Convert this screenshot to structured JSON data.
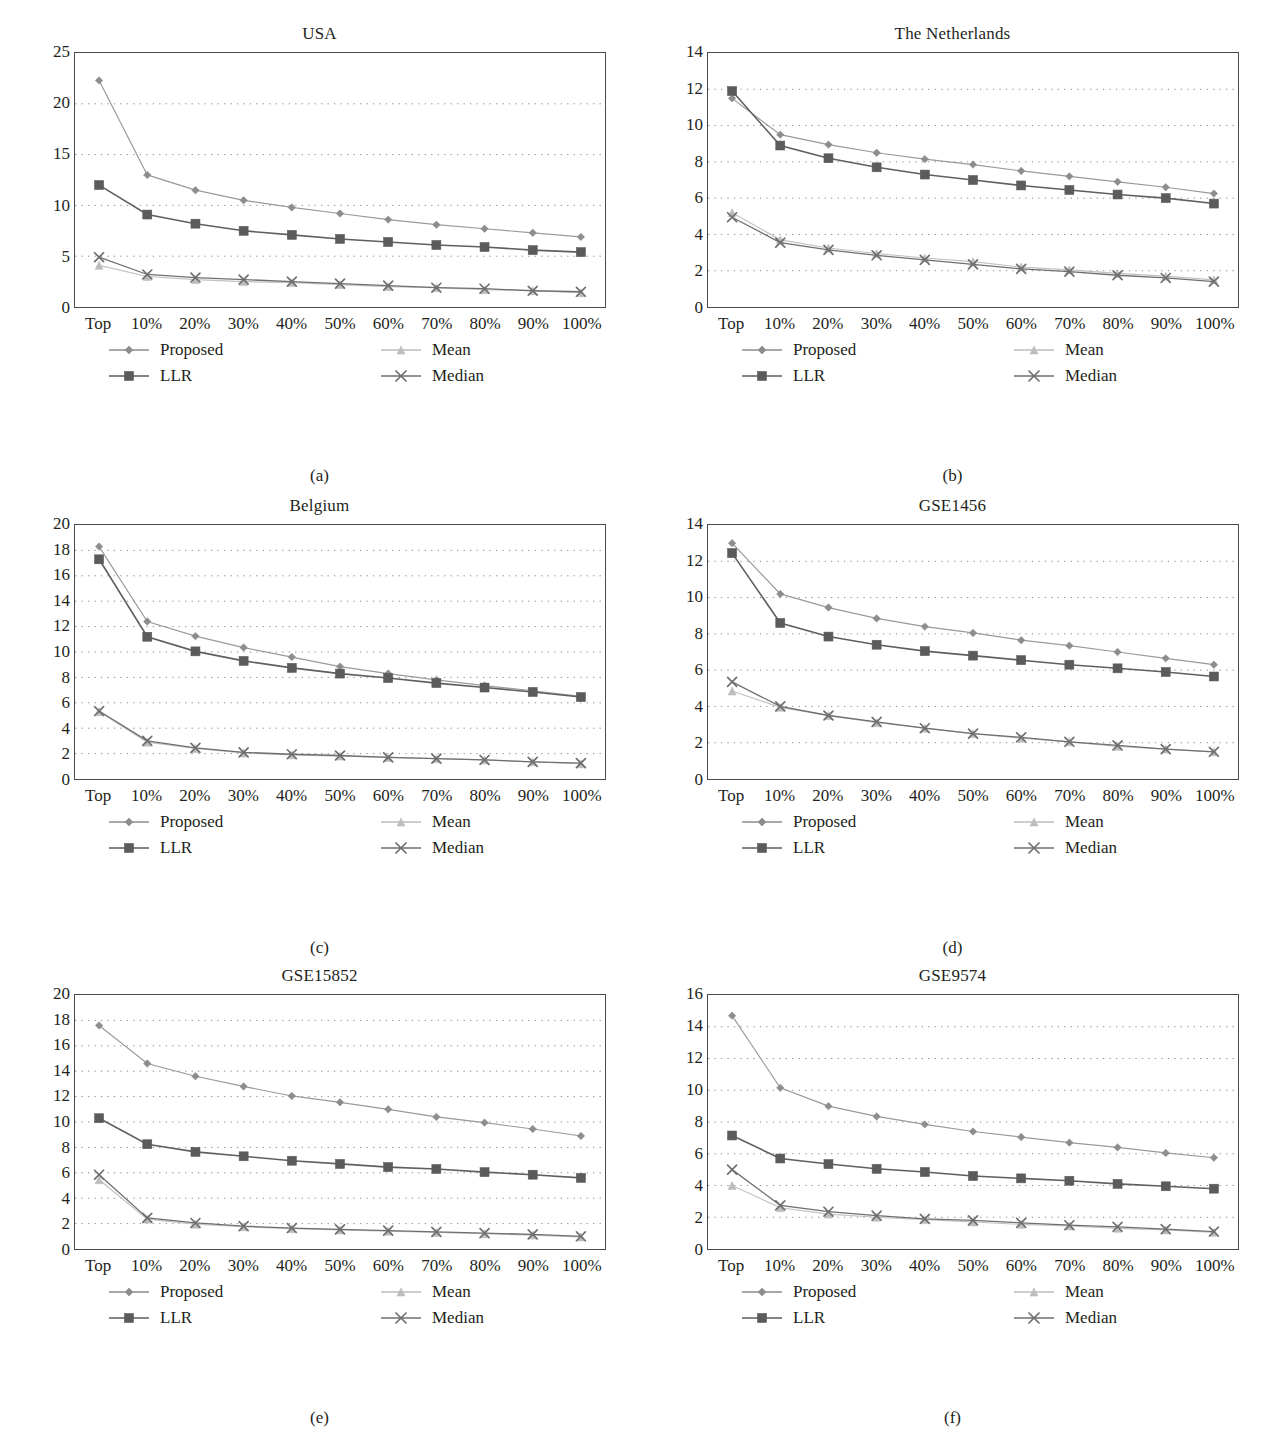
{
  "figure": {
    "y_axis_label_prefix": "Average absolute ",
    "y_axis_label_italic": "t",
    "y_axis_label_suffix": "-score",
    "categories": [
      "Top",
      "10%",
      "20%",
      "30%",
      "40%",
      "50%",
      "60%",
      "70%",
      "80%",
      "90%",
      "100%"
    ],
    "legend": [
      {
        "name": "Proposed",
        "marker": "diamond",
        "color": "#8d8d8d"
      },
      {
        "name": "LLR",
        "marker": "square",
        "color": "#5b5b5b"
      },
      {
        "name": "Mean",
        "marker": "triangle",
        "color": "#bdbdbd"
      },
      {
        "name": "Median",
        "marker": "x",
        "color": "#6f6f6f"
      }
    ]
  },
  "chart_data": [
    {
      "type": "line",
      "panel": "a",
      "caption": "(a)",
      "title": "USA",
      "xlabel": "",
      "ylabel": "Average absolute t-score",
      "categories": [
        "Top",
        "10%",
        "20%",
        "30%",
        "40%",
        "50%",
        "60%",
        "70%",
        "80%",
        "90%",
        "100%"
      ],
      "ylim": [
        0,
        25
      ],
      "yticks": [
        0,
        5,
        10,
        15,
        20,
        25
      ],
      "grid": true,
      "legend_position": "below",
      "series": [
        {
          "name": "Proposed",
          "values": [
            22.3,
            13.0,
            11.5,
            10.5,
            9.8,
            9.2,
            8.6,
            8.1,
            7.7,
            7.3,
            6.9
          ]
        },
        {
          "name": "LLR",
          "values": [
            12.0,
            9.1,
            8.2,
            7.5,
            7.1,
            6.7,
            6.4,
            6.1,
            5.9,
            5.6,
            5.4
          ]
        },
        {
          "name": "Mean",
          "values": [
            4.1,
            3.0,
            2.7,
            2.5,
            2.4,
            2.2,
            2.0,
            1.9,
            1.7,
            1.6,
            1.4
          ]
        },
        {
          "name": "Median",
          "values": [
            4.9,
            3.2,
            2.9,
            2.7,
            2.5,
            2.3,
            2.1,
            1.9,
            1.8,
            1.6,
            1.5
          ]
        }
      ]
    },
    {
      "type": "line",
      "panel": "b",
      "caption": "(b)",
      "title": "The Netherlands",
      "xlabel": "",
      "ylabel": "Average absolute t-score",
      "categories": [
        "Top",
        "10%",
        "20%",
        "30%",
        "40%",
        "50%",
        "60%",
        "70%",
        "80%",
        "90%",
        "100%"
      ],
      "ylim": [
        0,
        14
      ],
      "yticks": [
        0,
        2,
        4,
        6,
        8,
        10,
        12,
        14
      ],
      "grid": true,
      "legend_position": "below",
      "series": [
        {
          "name": "Proposed",
          "values": [
            11.5,
            9.5,
            8.95,
            8.5,
            8.15,
            7.85,
            7.5,
            7.2,
            6.9,
            6.6,
            6.25
          ]
        },
        {
          "name": "LLR",
          "values": [
            11.9,
            8.9,
            8.2,
            7.7,
            7.3,
            7.0,
            6.7,
            6.45,
            6.2,
            6.0,
            5.7
          ]
        },
        {
          "name": "Mean",
          "values": [
            5.2,
            3.7,
            3.25,
            2.95,
            2.7,
            2.5,
            2.2,
            2.05,
            1.85,
            1.7,
            1.5
          ]
        },
        {
          "name": "Median",
          "values": [
            4.95,
            3.55,
            3.15,
            2.85,
            2.6,
            2.35,
            2.1,
            1.95,
            1.75,
            1.6,
            1.4
          ]
        }
      ]
    },
    {
      "type": "line",
      "panel": "c",
      "caption": "(c)",
      "title": "Belgium",
      "xlabel": "",
      "ylabel": "Average absolute t-score",
      "categories": [
        "Top",
        "10%",
        "20%",
        "30%",
        "40%",
        "50%",
        "60%",
        "70%",
        "80%",
        "90%",
        "100%"
      ],
      "ylim": [
        0,
        20
      ],
      "yticks": [
        0,
        2,
        4,
        6,
        8,
        10,
        12,
        14,
        16,
        18,
        20
      ],
      "grid": true,
      "legend_position": "below",
      "series": [
        {
          "name": "Proposed",
          "values": [
            18.3,
            12.4,
            11.25,
            10.35,
            9.6,
            8.85,
            8.3,
            7.8,
            7.35,
            6.95,
            6.5
          ]
        },
        {
          "name": "LLR",
          "values": [
            17.3,
            11.2,
            10.05,
            9.3,
            8.75,
            8.3,
            7.95,
            7.55,
            7.2,
            6.85,
            6.45
          ]
        },
        {
          "name": "Mean",
          "values": [
            5.3,
            2.9,
            2.4,
            2.05,
            1.9,
            1.8,
            1.7,
            1.6,
            1.5,
            1.35,
            1.2
          ]
        },
        {
          "name": "Median",
          "values": [
            5.35,
            3.0,
            2.45,
            2.1,
            1.95,
            1.85,
            1.7,
            1.6,
            1.5,
            1.35,
            1.25
          ]
        }
      ]
    },
    {
      "type": "line",
      "panel": "d",
      "caption": "(d)",
      "title": "GSE1456",
      "xlabel": "",
      "ylabel": "Average absolute t-score",
      "categories": [
        "Top",
        "10%",
        "20%",
        "30%",
        "40%",
        "50%",
        "60%",
        "70%",
        "80%",
        "90%",
        "100%"
      ],
      "ylim": [
        0,
        14
      ],
      "yticks": [
        0,
        2,
        4,
        6,
        8,
        10,
        12,
        14
      ],
      "grid": true,
      "legend_position": "below",
      "series": [
        {
          "name": "Proposed",
          "values": [
            13.0,
            10.2,
            9.45,
            8.85,
            8.4,
            8.05,
            7.65,
            7.35,
            7.0,
            6.65,
            6.3
          ]
        },
        {
          "name": "LLR",
          "values": [
            12.45,
            8.6,
            7.85,
            7.4,
            7.05,
            6.8,
            6.55,
            6.3,
            6.1,
            5.9,
            5.65
          ]
        },
        {
          "name": "Mean",
          "values": [
            4.85,
            3.95,
            3.5,
            3.1,
            2.8,
            2.5,
            2.25,
            2.05,
            1.8,
            1.65,
            1.5
          ]
        },
        {
          "name": "Median",
          "values": [
            5.35,
            4.0,
            3.5,
            3.15,
            2.8,
            2.5,
            2.3,
            2.05,
            1.85,
            1.65,
            1.5
          ]
        }
      ]
    },
    {
      "type": "line",
      "panel": "e",
      "caption": "(e)",
      "title": "GSE15852",
      "xlabel": "",
      "ylabel": "Average absolute t-score",
      "categories": [
        "Top",
        "10%",
        "20%",
        "30%",
        "40%",
        "50%",
        "60%",
        "70%",
        "80%",
        "90%",
        "100%"
      ],
      "ylim": [
        0,
        20
      ],
      "yticks": [
        0,
        2,
        4,
        6,
        8,
        10,
        12,
        14,
        16,
        18,
        20
      ],
      "grid": true,
      "legend_position": "below",
      "series": [
        {
          "name": "Proposed",
          "values": [
            17.6,
            14.6,
            13.6,
            12.8,
            12.05,
            11.55,
            11.0,
            10.4,
            9.95,
            9.45,
            8.9
          ]
        },
        {
          "name": "LLR",
          "values": [
            10.3,
            8.25,
            7.65,
            7.3,
            6.95,
            6.7,
            6.45,
            6.3,
            6.05,
            5.85,
            5.6
          ]
        },
        {
          "name": "Mean",
          "values": [
            5.45,
            2.35,
            1.95,
            1.75,
            1.6,
            1.5,
            1.4,
            1.3,
            1.2,
            1.1,
            0.95
          ]
        },
        {
          "name": "Median",
          "values": [
            5.85,
            2.45,
            2.05,
            1.8,
            1.65,
            1.55,
            1.45,
            1.35,
            1.25,
            1.15,
            1.0
          ]
        }
      ]
    },
    {
      "type": "line",
      "panel": "f",
      "caption": "(f)",
      "title": "GSE9574",
      "xlabel": "",
      "ylabel": "Average absolute t-score",
      "categories": [
        "Top",
        "10%",
        "20%",
        "30%",
        "40%",
        "50%",
        "60%",
        "70%",
        "80%",
        "90%",
        "100%"
      ],
      "ylim": [
        0,
        16
      ],
      "yticks": [
        0,
        2,
        4,
        6,
        8,
        10,
        12,
        14,
        16
      ],
      "grid": true,
      "legend_position": "below",
      "series": [
        {
          "name": "Proposed",
          "values": [
            14.7,
            10.15,
            9.0,
            8.35,
            7.85,
            7.4,
            7.05,
            6.7,
            6.4,
            6.05,
            5.75
          ]
        },
        {
          "name": "LLR",
          "values": [
            7.15,
            5.7,
            5.35,
            5.05,
            4.85,
            4.6,
            4.45,
            4.3,
            4.1,
            3.95,
            3.8
          ]
        },
        {
          "name": "Mean",
          "values": [
            4.0,
            2.6,
            2.2,
            2.0,
            1.85,
            1.7,
            1.55,
            1.45,
            1.3,
            1.2,
            1.05
          ]
        },
        {
          "name": "Median",
          "values": [
            5.0,
            2.75,
            2.35,
            2.1,
            1.9,
            1.8,
            1.65,
            1.5,
            1.4,
            1.25,
            1.1
          ]
        }
      ]
    }
  ]
}
